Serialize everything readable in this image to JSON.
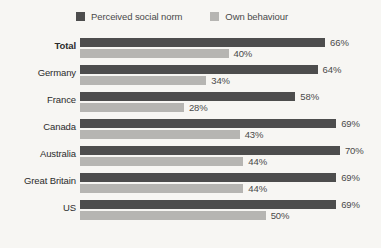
{
  "chart_data": {
    "type": "bar",
    "title": "",
    "subtitle": "",
    "xlabel": "",
    "ylabel": "",
    "orientation": "horizontal",
    "grid": false,
    "legend_position": "top",
    "xlim": [
      0,
      80
    ],
    "value_suffix": "%",
    "categories": [
      "Total",
      "Germany",
      "France",
      "Canada",
      "Australia",
      "Great Britain",
      "US"
    ],
    "series": [
      {
        "name": "Perceived social norm",
        "color": "#4d4d4d",
        "values": [
          66,
          64,
          58,
          69,
          70,
          69,
          69
        ],
        "labels": [
          "66%",
          "64%",
          "58%",
          "69%",
          "70%",
          "69%",
          "69%"
        ]
      },
      {
        "name": "Own behaviour",
        "color": "#b6b5b2",
        "values": [
          40,
          34,
          28,
          43,
          44,
          44,
          50
        ],
        "labels": [
          "40%",
          "34%",
          "28%",
          "43%",
          "44%",
          "44%",
          "50%"
        ]
      }
    ],
    "emphasized_category": "Total"
  },
  "legend": {
    "items": [
      {
        "label": "Perceived social norm",
        "swatch": "dark"
      },
      {
        "label": "Own behaviour",
        "swatch": "light"
      }
    ]
  },
  "colors": {
    "background": "#f7f6f3",
    "series_dark": "#4d4d4d",
    "series_light": "#b6b5b2",
    "label_text": "#2b2b2b",
    "value_text": "#4a4a4a"
  }
}
